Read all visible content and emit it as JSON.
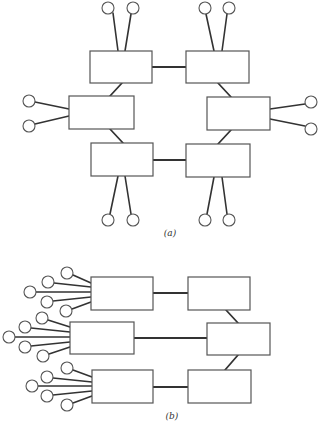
{
  "figure": {
    "panels": [
      {
        "id": "a",
        "caption": "(a)",
        "caption_pos": [
          170,
          236
        ],
        "description": "Ring of six switching boxes, each with two terminal nodes",
        "boxes": [
          {
            "id": "a-tl",
            "x": 90,
            "y": 51,
            "w": 62,
            "h": 32
          },
          {
            "id": "a-tr",
            "x": 186,
            "y": 51,
            "w": 63,
            "h": 32
          },
          {
            "id": "a-ml",
            "x": 69,
            "y": 96,
            "w": 65,
            "h": 33
          },
          {
            "id": "a-mr",
            "x": 207,
            "y": 97,
            "w": 63,
            "h": 33
          },
          {
            "id": "a-bl",
            "x": 91,
            "y": 143,
            "w": 62,
            "h": 33
          },
          {
            "id": "a-br",
            "x": 186,
            "y": 144,
            "w": 64,
            "h": 33
          }
        ],
        "links": [
          {
            "from": "a-tl",
            "to": "a-tr",
            "x1": 152,
            "y1": 67,
            "x2": 186,
            "y2": 67
          },
          {
            "from": "a-tl",
            "to": "a-ml",
            "x1": 122,
            "y1": 83,
            "x2": 110,
            "y2": 96
          },
          {
            "from": "a-tr",
            "to": "a-mr",
            "x1": 218,
            "y1": 83,
            "x2": 231,
            "y2": 97
          },
          {
            "from": "a-ml",
            "to": "a-bl",
            "x1": 110,
            "y1": 129,
            "x2": 123,
            "y2": 143
          },
          {
            "from": "a-mr",
            "to": "a-br",
            "x1": 231,
            "y1": 130,
            "x2": 218,
            "y2": 144
          },
          {
            "from": "a-bl",
            "to": "a-br",
            "x1": 153,
            "y1": 160,
            "x2": 186,
            "y2": 160
          }
        ],
        "terminals": [
          {
            "box": "a-tl",
            "cx": 108,
            "cy": 8,
            "x1": 113,
            "y1": 13,
            "x2": 118,
            "y2": 51
          },
          {
            "box": "a-tl",
            "cx": 133,
            "cy": 8,
            "x1": 131,
            "y1": 14,
            "x2": 125,
            "y2": 51
          },
          {
            "box": "a-tr",
            "cx": 205,
            "cy": 8,
            "x1": 206,
            "y1": 14,
            "x2": 214,
            "y2": 51
          },
          {
            "box": "a-tr",
            "cx": 229,
            "cy": 8,
            "x1": 227,
            "y1": 14,
            "x2": 222,
            "y2": 51
          },
          {
            "box": "a-ml",
            "cx": 29,
            "cy": 101,
            "x1": 35,
            "y1": 102,
            "x2": 69,
            "y2": 109
          },
          {
            "box": "a-ml",
            "cx": 29,
            "cy": 126,
            "x1": 35,
            "y1": 124,
            "x2": 69,
            "y2": 116
          },
          {
            "box": "a-mr",
            "cx": 311,
            "cy": 102,
            "x1": 305,
            "y1": 104,
            "x2": 270,
            "y2": 109
          },
          {
            "box": "a-mr",
            "cx": 311,
            "cy": 129,
            "x1": 305,
            "y1": 126,
            "x2": 270,
            "y2": 119
          },
          {
            "box": "a-bl",
            "cx": 108,
            "cy": 220,
            "x1": 110,
            "y1": 214,
            "x2": 118,
            "y2": 176
          },
          {
            "box": "a-bl",
            "cx": 133,
            "cy": 220,
            "x1": 131,
            "y1": 214,
            "x2": 125,
            "y2": 176
          },
          {
            "box": "a-br",
            "cx": 205,
            "cy": 220,
            "x1": 207,
            "y1": 214,
            "x2": 214,
            "y2": 177
          },
          {
            "box": "a-br",
            "cx": 229,
            "cy": 220,
            "x1": 227,
            "y1": 214,
            "x2": 222,
            "y2": 177
          }
        ]
      },
      {
        "id": "b",
        "caption": "(b)",
        "caption_pos": [
          172,
          419
        ],
        "description": "Three concentrator boxes with five terminals each feeding a chain of three boxes",
        "boxes": [
          {
            "id": "b-1",
            "x": 91,
            "y": 277,
            "w": 62,
            "h": 33
          },
          {
            "id": "b-2",
            "x": 188,
            "y": 277,
            "w": 62,
            "h": 33
          },
          {
            "id": "b-3",
            "x": 70,
            "y": 322,
            "w": 64,
            "h": 32
          },
          {
            "id": "b-4",
            "x": 207,
            "y": 323,
            "w": 63,
            "h": 32
          },
          {
            "id": "b-5",
            "x": 92,
            "y": 370,
            "w": 61,
            "h": 33
          },
          {
            "id": "b-6",
            "x": 188,
            "y": 370,
            "w": 63,
            "h": 33
          }
        ],
        "links": [
          {
            "from": "b-1",
            "to": "b-2",
            "x1": 153,
            "y1": 293,
            "x2": 188,
            "y2": 293
          },
          {
            "from": "b-3",
            "to": "b-4",
            "x1": 134,
            "y1": 338,
            "x2": 207,
            "y2": 338
          },
          {
            "from": "b-5",
            "to": "b-6",
            "x1": 153,
            "y1": 387,
            "x2": 188,
            "y2": 387
          },
          {
            "from": "b-2",
            "to": "b-4",
            "x1": 226,
            "y1": 310,
            "x2": 238,
            "y2": 323
          },
          {
            "from": "b-4",
            "to": "b-6",
            "x1": 238,
            "y1": 355,
            "x2": 225,
            "y2": 370
          }
        ],
        "terminals": [
          {
            "box": "b-1",
            "cx": 67,
            "cy": 273,
            "x1": 73,
            "y1": 275,
            "x2": 91,
            "y2": 283
          },
          {
            "box": "b-1",
            "cx": 48,
            "cy": 282,
            "x1": 54,
            "y1": 283,
            "x2": 91,
            "y2": 287
          },
          {
            "box": "b-1",
            "cx": 30,
            "cy": 292,
            "x1": 36,
            "y1": 292,
            "x2": 91,
            "y2": 292
          },
          {
            "box": "b-1",
            "cx": 47,
            "cy": 302,
            "x1": 53,
            "y1": 301,
            "x2": 91,
            "y2": 297
          },
          {
            "box": "b-1",
            "cx": 66,
            "cy": 311,
            "x1": 72,
            "y1": 309,
            "x2": 91,
            "y2": 302
          },
          {
            "box": "b-3",
            "cx": 42,
            "cy": 318,
            "x1": 48,
            "y1": 320,
            "x2": 70,
            "y2": 327
          },
          {
            "box": "b-3",
            "cx": 25,
            "cy": 327,
            "x1": 31,
            "y1": 328,
            "x2": 70,
            "y2": 332
          },
          {
            "box": "b-3",
            "cx": 9,
            "cy": 337,
            "x1": 15,
            "y1": 337,
            "x2": 70,
            "y2": 337
          },
          {
            "box": "b-3",
            "cx": 25,
            "cy": 347,
            "x1": 31,
            "y1": 346,
            "x2": 70,
            "y2": 342
          },
          {
            "box": "b-3",
            "cx": 43,
            "cy": 356,
            "x1": 49,
            "y1": 354,
            "x2": 70,
            "y2": 347
          },
          {
            "box": "b-5",
            "cx": 67,
            "cy": 368,
            "x1": 73,
            "y1": 370,
            "x2": 92,
            "y2": 377
          },
          {
            "box": "b-5",
            "cx": 47,
            "cy": 377,
            "x1": 53,
            "y1": 378,
            "x2": 92,
            "y2": 382
          },
          {
            "box": "b-5",
            "cx": 32,
            "cy": 386,
            "x1": 38,
            "y1": 386,
            "x2": 92,
            "y2": 386
          },
          {
            "box": "b-5",
            "cx": 47,
            "cy": 396,
            "x1": 53,
            "y1": 395,
            "x2": 92,
            "y2": 391
          },
          {
            "box": "b-5",
            "cx": 67,
            "cy": 405,
            "x1": 73,
            "y1": 403,
            "x2": 92,
            "y2": 396
          }
        ]
      }
    ],
    "style": {
      "terminal_radius": 6,
      "line_color": "#333333",
      "box_stroke": "#555555",
      "background": "#ffffff"
    }
  }
}
